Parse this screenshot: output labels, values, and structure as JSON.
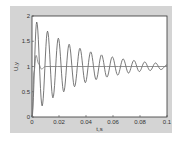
{
  "chart_data": {
    "type": "line",
    "title": "",
    "xlabel": "t,s",
    "ylabel": "U,y",
    "xlim": [
      0,
      0.1
    ],
    "ylim": [
      0,
      2
    ],
    "xticks": [
      "0",
      "0.02",
      "0.04",
      "0.06",
      "0.08",
      "0.1"
    ],
    "yticks": [
      "0",
      "0.5",
      "1",
      "1.5",
      "2"
    ],
    "grid": false,
    "series": [
      {
        "name": "oscillatory response",
        "description": "underdamped oscillation around 1, period ~0.008 s, decaying",
        "x": [
          0,
          0.0035,
          0.0075,
          0.0115,
          0.0155,
          0.0195,
          0.0235,
          0.0275,
          0.0315,
          0.0355,
          0.0395,
          0.0435,
          0.0475,
          0.0515,
          0.0555,
          0.0595,
          0.0635,
          0.0675,
          0.0715,
          0.0755,
          0.0795,
          0.0835,
          0.0875,
          0.0915,
          0.0955,
          0.1
        ],
        "y": [
          0,
          1.88,
          0.22,
          1.7,
          0.38,
          1.56,
          0.5,
          1.44,
          0.6,
          1.36,
          0.68,
          1.29,
          0.74,
          1.23,
          0.79,
          1.19,
          0.83,
          1.15,
          0.87,
          1.12,
          0.9,
          1.09,
          0.92,
          1.07,
          0.94,
          1.03
        ]
      },
      {
        "name": "damped response",
        "description": "fast response settling to 1",
        "x": [
          0,
          0.0015,
          0.003,
          0.005,
          0.007,
          0.01,
          0.1
        ],
        "y": [
          0,
          0.9,
          1.22,
          1.05,
          0.95,
          1.0,
          1.0
        ]
      }
    ]
  }
}
